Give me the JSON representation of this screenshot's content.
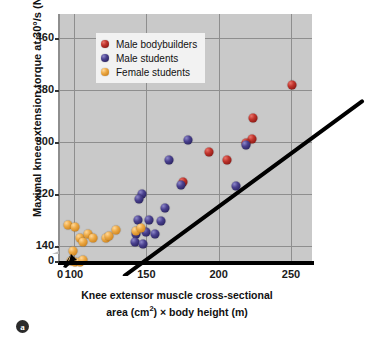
{
  "panel": {
    "tag": "a"
  },
  "chart_data": {
    "type": "scatter",
    "title": "",
    "xlabel_line1": "Knee extensor muscle cross-sectional",
    "xlabel_line2_pre": "area (cm",
    "xlabel_line2_sup": "2",
    "xlabel_line2_post": ") × body height (m)",
    "ylabel": "Maximal knee extension torque at 30°/s (N-m)",
    "xlim": [
      90,
      265
    ],
    "ylim": [
      100,
      480
    ],
    "xticks": [
      0,
      100,
      150,
      200,
      250
    ],
    "yticks": [
      0,
      140,
      220,
      300,
      380,
      460
    ],
    "x_axis_break_after": 0,
    "y_axis_break_after": 0,
    "grid": true,
    "grid_color": "#8e8e8e",
    "plot_background": "#c9c9c9",
    "legend_position": "upper-left-inside",
    "legend": [
      {
        "label": "Male bodybuilders",
        "color": "#c0342c",
        "marker": "sphere"
      },
      {
        "label": "Male students",
        "color": "#4a418f",
        "marker": "sphere"
      },
      {
        "label": "Female students",
        "color": "#eda944",
        "marker": "sphere"
      }
    ],
    "series": [
      {
        "name": "Male bodybuilders",
        "color": "#c0342c",
        "points": [
          [
            251,
            388
          ],
          [
            224,
            337
          ],
          [
            223,
            305
          ],
          [
            219,
            299
          ],
          [
            206,
            272
          ],
          [
            193,
            285
          ],
          [
            175,
            239
          ]
        ]
      },
      {
        "name": "Male students",
        "color": "#4a418f",
        "points": [
          [
            179,
            303
          ],
          [
            219,
            296
          ],
          [
            212,
            232
          ],
          [
            174,
            234
          ],
          [
            166,
            272
          ],
          [
            163,
            199
          ],
          [
            160,
            178
          ],
          [
            152,
            180
          ],
          [
            150,
            162
          ],
          [
            147,
            220
          ],
          [
            145,
            212
          ],
          [
            144,
            180
          ],
          [
            143,
            159
          ],
          [
            142,
            146
          ],
          [
            156,
            158
          ],
          [
            148,
            143
          ]
        ]
      },
      {
        "name": "Female students",
        "color": "#eda944",
        "points": [
          [
            96,
            172
          ],
          [
            101,
            170
          ],
          [
            104,
            152
          ],
          [
            106,
            146
          ],
          [
            110,
            158
          ],
          [
            113,
            152
          ],
          [
            122,
            152
          ],
          [
            124,
            155
          ],
          [
            129,
            165
          ],
          [
            99,
            133
          ],
          [
            98,
            117
          ],
          [
            101,
            115
          ],
          [
            104,
            116
          ],
          [
            106,
            118
          ],
          [
            143,
            163
          ],
          [
            146,
            168
          ]
        ]
      }
    ],
    "regression_line": {
      "color": "#000000",
      "width_px": 4,
      "x_start": 95,
      "y_start": 116,
      "x_end": 259,
      "y_end": 384
    }
  }
}
